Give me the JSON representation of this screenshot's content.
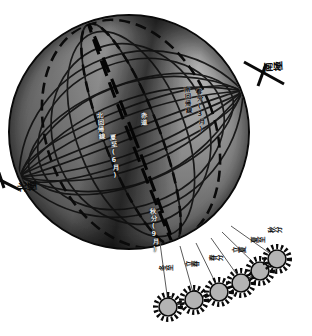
{
  "diagram": {
    "kind": "earth-sun seasonal diagram",
    "orientation_note": "図は時計回りに90度回転",
    "colors": {
      "ink": "#0a0a0a",
      "globe_light": "#b9b9b9",
      "globe_dark": "#3a3a3a",
      "sun_fill": "#b3b3b3",
      "background": "#ffffff"
    }
  },
  "poles": {
    "north": {
      "label": "北極",
      "position": "lower-left"
    },
    "south": {
      "label": "南極",
      "position": "upper-right"
    }
  },
  "globe_labels": [
    {
      "id": "glabel-1",
      "text": "北回帰線"
    },
    {
      "id": "glabel-2",
      "text": "赤道"
    },
    {
      "id": "glabel-3",
      "text": "南回帰線"
    },
    {
      "id": "glabel-4",
      "text": "夏至(6月)"
    },
    {
      "id": "glabel-5",
      "text": "春分(3月)"
    },
    {
      "id": "glabel-6",
      "text": "秋分(9月)"
    }
  ],
  "sun_chain": {
    "count": 6,
    "icon": "sun-icon",
    "suns": [
      {
        "id": "sun-1",
        "label": "冬至"
      },
      {
        "id": "sun-2",
        "label": "立春"
      },
      {
        "id": "sun-3",
        "label": "春分"
      },
      {
        "id": "sun-4",
        "label": "立夏"
      },
      {
        "id": "sun-5",
        "label": "夏至"
      },
      {
        "id": "sun-6",
        "label": "秋分"
      }
    ]
  },
  "grid": {
    "latitude_lines": 9,
    "longitude_lines": 9,
    "dashed_meridians": 3,
    "visible": true
  }
}
